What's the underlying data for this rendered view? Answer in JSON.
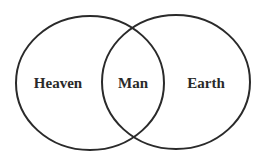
{
  "diagram": {
    "type": "venn",
    "sets": [
      {
        "id": "left",
        "label": "Heaven"
      },
      {
        "id": "right",
        "label": "Earth"
      }
    ],
    "intersection": {
      "label": "Man"
    },
    "stroke_color": "#2a2a2a"
  }
}
